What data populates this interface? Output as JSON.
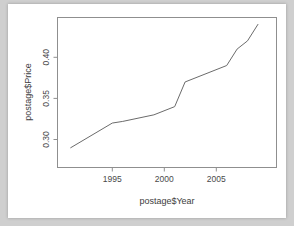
{
  "chart_data": {
    "type": "line",
    "title": "",
    "xlabel": "postage$Year",
    "ylabel": "postage$Price",
    "x": [
      1991,
      1995,
      1996,
      1999,
      2001,
      2002,
      2006,
      2007,
      2008,
      2009
    ],
    "values": [
      0.29,
      0.32,
      0.322,
      0.33,
      0.34,
      0.37,
      0.39,
      0.41,
      0.42,
      0.44
    ],
    "series": [
      {
        "name": "postage$Price",
        "points": [
          {
            "x": 1991,
            "y": 0.29
          },
          {
            "x": 1995,
            "y": 0.32
          },
          {
            "x": 1996,
            "y": 0.322
          },
          {
            "x": 1999,
            "y": 0.33
          },
          {
            "x": 2001,
            "y": 0.34
          },
          {
            "x": 2002,
            "y": 0.37
          },
          {
            "x": 2006,
            "y": 0.39
          },
          {
            "x": 2007,
            "y": 0.41
          },
          {
            "x": 2008,
            "y": 0.42
          },
          {
            "x": 2009,
            "y": 0.44
          }
        ]
      }
    ],
    "xticks": [
      1995,
      2000,
      2005
    ],
    "xtick_labels": [
      "1995",
      "2000",
      "2005"
    ],
    "yticks": [
      0.3,
      0.35,
      0.4
    ],
    "ytick_labels": [
      "0.30",
      "0.35",
      "0.40"
    ],
    "xlim": [
      1990.5,
      2009.5
    ],
    "ylim": [
      0.2855,
      0.4425
    ],
    "grid": false,
    "legend": false,
    "line_color": "#6b6b6b",
    "axis_color": "#8f8f8f",
    "background": "#ffffff"
  },
  "axis": {
    "x_label": "postage$Year",
    "y_label": "postage$Price",
    "x_tick_1": "1995",
    "x_tick_2": "2000",
    "x_tick_3": "2005",
    "y_tick_1": "0.30",
    "y_tick_2": "0.35",
    "y_tick_3": "0.40"
  }
}
